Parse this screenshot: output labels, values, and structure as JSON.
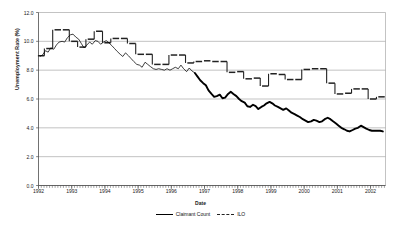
{
  "chart_data": {
    "type": "line",
    "title": "",
    "xlabel": "Date",
    "ylabel": "Unemployment Rate (%)",
    "xlim": [
      1992.0,
      2002.45
    ],
    "ylim": [
      0.0,
      12.0
    ],
    "grid": true,
    "grid_axis": "y",
    "legend_position": "bottom-center",
    "ytick_labels": [
      "0.0",
      "2.0",
      "4.0",
      "6.0",
      "8.0",
      "10.0",
      "12.0"
    ],
    "ytick_values": [
      0.0,
      2.0,
      4.0,
      6.0,
      8.0,
      10.0,
      12.0
    ],
    "xtick_labels": [
      "1992",
      "1993",
      "1994",
      "1995",
      "1996",
      "1997",
      "1998",
      "1999",
      "2000",
      "2001",
      "2002"
    ],
    "xtick_values": [
      1992,
      1993,
      1994,
      1995,
      1996,
      1997,
      1998,
      1999,
      2000,
      2001,
      2002
    ],
    "minor_xticks": "monthly",
    "series": [
      {
        "name": "Claimant Count",
        "style": "solid",
        "color": "#000000",
        "x": [
          1992.04,
          1992.12,
          1992.21,
          1992.29,
          1992.37,
          1992.46,
          1992.54,
          1992.62,
          1992.71,
          1992.79,
          1992.87,
          1992.96,
          1993.04,
          1993.12,
          1993.21,
          1993.29,
          1993.37,
          1993.46,
          1993.54,
          1993.62,
          1993.71,
          1993.79,
          1993.87,
          1993.96,
          1994.04,
          1994.12,
          1994.21,
          1994.29,
          1994.37,
          1994.46,
          1994.54,
          1994.62,
          1994.71,
          1994.79,
          1994.87,
          1994.96,
          1995.04,
          1995.12,
          1995.21,
          1995.29,
          1995.37,
          1995.46,
          1995.54,
          1995.62,
          1995.71,
          1995.79,
          1995.87,
          1995.96,
          1996.04,
          1996.12,
          1996.21,
          1996.29,
          1996.37,
          1996.46,
          1996.54,
          1996.62,
          1996.71,
          1996.79,
          1996.87,
          1996.96,
          1997.04,
          1997.12,
          1997.21,
          1997.29,
          1997.37,
          1997.46,
          1997.54,
          1997.62,
          1997.71,
          1997.79,
          1997.87,
          1997.96,
          1998.04,
          1998.12,
          1998.21,
          1998.29,
          1998.37,
          1998.46,
          1998.54,
          1998.62,
          1998.71,
          1998.79,
          1998.87,
          1998.96,
          1999.04,
          1999.12,
          1999.21,
          1999.29,
          1999.37,
          1999.46,
          1999.54,
          1999.62,
          1999.71,
          1999.79,
          1999.87,
          1999.96,
          2000.04,
          2000.12,
          2000.21,
          2000.29,
          2000.37,
          2000.46,
          2000.54,
          2000.62,
          2000.71,
          2000.79,
          2000.87,
          2000.96,
          2001.04,
          2001.12,
          2001.21,
          2001.29,
          2001.37,
          2001.46,
          2001.54,
          2001.62,
          2001.71,
          2001.79,
          2001.87,
          2001.96,
          2002.04,
          2002.12,
          2002.21,
          2002.29,
          2002.37
        ],
        "y": [
          8.95,
          9.05,
          9.35,
          9.25,
          9.55,
          9.45,
          9.75,
          9.95,
          10.0,
          9.95,
          10.25,
          10.45,
          10.5,
          10.3,
          10.15,
          9.85,
          9.55,
          9.75,
          9.95,
          9.8,
          10.05,
          10.0,
          9.8,
          9.95,
          10.05,
          9.9,
          9.7,
          9.5,
          9.3,
          9.1,
          8.95,
          9.2,
          9.0,
          8.8,
          8.6,
          8.4,
          8.35,
          8.2,
          8.55,
          8.4,
          8.25,
          8.1,
          8.05,
          8.1,
          8.05,
          8.0,
          8.1,
          8.0,
          8.1,
          8.2,
          8.1,
          8.35,
          8.1,
          7.9,
          8.15,
          7.95,
          7.8,
          7.55,
          7.3,
          7.1,
          6.95,
          6.6,
          6.35,
          6.15,
          6.2,
          6.3,
          6.05,
          6.1,
          6.35,
          6.5,
          6.35,
          6.2,
          6.0,
          5.85,
          5.75,
          5.5,
          5.45,
          5.6,
          5.5,
          5.3,
          5.45,
          5.55,
          5.7,
          5.8,
          5.7,
          5.55,
          5.45,
          5.35,
          5.25,
          5.35,
          5.2,
          5.05,
          4.95,
          4.85,
          4.75,
          4.6,
          4.5,
          4.4,
          4.45,
          4.55,
          4.5,
          4.4,
          4.45,
          4.6,
          4.7,
          4.6,
          4.45,
          4.3,
          4.15,
          4.0,
          3.9,
          3.8,
          3.75,
          3.85,
          3.95,
          4.0,
          4.15,
          4.05,
          3.95,
          3.85,
          3.8,
          3.8,
          3.8,
          3.8,
          3.75
        ],
        "emphasis_from_x": 1996.7,
        "emphasis_note": "Line is drawn thin before late 1996 and thick (bold) thereafter"
      },
      {
        "name": "ILO",
        "style": "dashed-step",
        "color": "#222222",
        "x": [
          1992.08,
          1992.33,
          1992.58,
          1992.83,
          1993.08,
          1993.33,
          1993.58,
          1993.83,
          1994.08,
          1994.33,
          1994.58,
          1994.83,
          1995.08,
          1995.33,
          1995.58,
          1995.83,
          1996.08,
          1996.33,
          1996.58,
          1996.83,
          1997.08,
          1997.33,
          1997.58,
          1997.83,
          1998.08,
          1998.33,
          1998.58,
          1998.83,
          1999.08,
          1999.33,
          1999.58,
          1999.83,
          2000.08,
          2000.33,
          2000.58,
          2000.83,
          2001.08,
          2001.33,
          2001.58,
          2001.83,
          2002.08,
          2002.33
        ],
        "y": [
          9.0,
          9.5,
          10.8,
          10.8,
          10.0,
          9.6,
          10.15,
          10.7,
          9.9,
          10.2,
          10.2,
          9.85,
          9.1,
          9.1,
          8.4,
          8.4,
          9.05,
          9.05,
          8.5,
          8.6,
          8.65,
          8.6,
          8.6,
          7.85,
          7.9,
          7.4,
          7.45,
          6.9,
          7.75,
          7.7,
          7.35,
          7.35,
          8.05,
          8.1,
          8.1,
          7.1,
          6.35,
          6.4,
          6.7,
          6.7,
          6.0,
          6.15
        ],
        "step_note": "Quarterly values drawn as short horizontal dashes (step marks), not connected"
      }
    ]
  },
  "legend": {
    "entries": [
      {
        "label": "Claimant Count",
        "marker": "solid-line"
      },
      {
        "label": "ILO",
        "marker": "dashed-line"
      }
    ]
  },
  "axes": {
    "y_title": "Unemployment Rate (%)",
    "x_title": "Date"
  },
  "colors": {
    "claimant": "#000000",
    "ilo": "#333333",
    "grid": "#9a9a9a",
    "axis": "#4d4d4d",
    "background": "#ffffff"
  }
}
